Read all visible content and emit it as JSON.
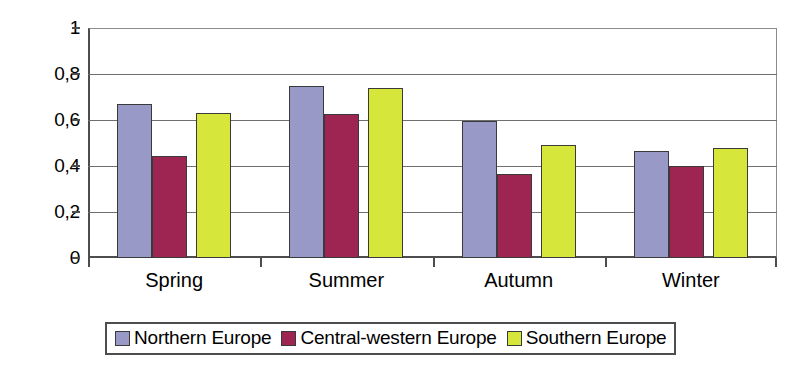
{
  "chart_data": {
    "type": "bar",
    "title": "",
    "xlabel": "",
    "ylabel": "",
    "ylim": [
      0,
      1
    ],
    "grid": true,
    "legend_position": "bottom",
    "decimal_separator": ",",
    "categories": [
      "Spring",
      "Summer",
      "Autumn",
      "Winter"
    ],
    "ytick_labels": [
      "1",
      "0,8",
      "0,6",
      "0,4",
      "0,2",
      "0"
    ],
    "ytick_values": [
      1,
      0.8,
      0.6,
      0.4,
      0.2,
      0
    ],
    "series": [
      {
        "name": "Northern Europe",
        "color": "#9999c7",
        "values": [
          0.67,
          0.75,
          0.595,
          0.465
        ]
      },
      {
        "name": "Central-western Europe",
        "color": "#9e2552",
        "values": [
          0.445,
          0.625,
          0.365,
          0.4
        ]
      },
      {
        "name": "Southern Europe",
        "color": "#d7e63a",
        "values": [
          0.63,
          0.74,
          0.49,
          0.48
        ]
      }
    ]
  }
}
